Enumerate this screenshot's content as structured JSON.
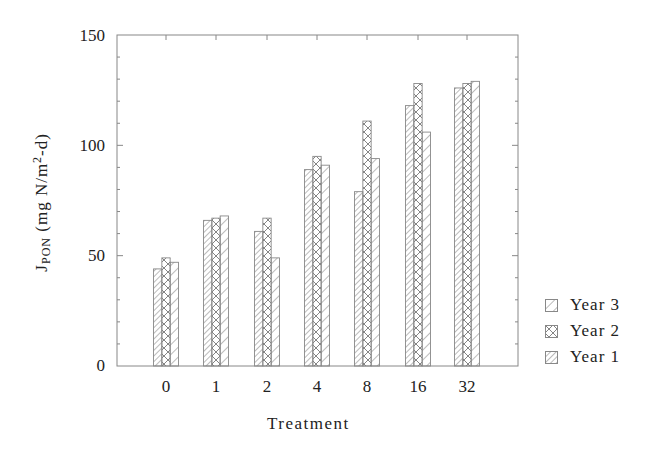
{
  "chart_data": {
    "type": "bar",
    "title": "",
    "xlabel": "Treatment",
    "ylabel": "JPON (mg N/m^2-d)",
    "ylabel_parts": {
      "main": "J",
      "sub": "PON",
      "units_pre": "(mg N/m",
      "sup": "2",
      "units_post": "-d)"
    },
    "ylim": [
      0,
      150
    ],
    "yticks": [
      0,
      50,
      100,
      150
    ],
    "categories": [
      "0",
      "1",
      "2",
      "4",
      "8",
      "16",
      "32"
    ],
    "series": [
      {
        "name": "Year 3",
        "pattern": "dense-diagonal",
        "values": [
          44,
          66,
          61,
          89,
          79,
          118,
          126
        ]
      },
      {
        "name": "Year 2",
        "pattern": "crosshatch",
        "values": [
          49,
          67,
          67,
          95,
          111,
          128,
          128
        ]
      },
      {
        "name": "Year 1",
        "pattern": "sparse-diagonal",
        "values": [
          47,
          68,
          49,
          91,
          94,
          106,
          129
        ]
      }
    ],
    "legend": {
      "position": "right",
      "entries": [
        "Year 3",
        "Year 2",
        "Year 1"
      ]
    },
    "grid": false
  },
  "legend_labels": [
    "Year 3",
    "Year 2",
    "Year 1"
  ],
  "axis": {
    "xlabel": "Treatment",
    "yticks": [
      "150",
      "100",
      "50",
      "0"
    ],
    "xticks": [
      "0",
      "1",
      "2",
      "4",
      "8",
      "16",
      "32"
    ]
  },
  "colors": {
    "axis": "#888888",
    "hatch": "#777777",
    "text": "#222222"
  }
}
